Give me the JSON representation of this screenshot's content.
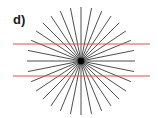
{
  "label": "d)",
  "figure": {
    "name": "Hering illusion",
    "center": [
      81,
      61
    ],
    "ray_count": 32,
    "ray_radius": 54,
    "ray_color": "#3a3a3a",
    "center_dot_color": "#000000",
    "parallel_lines": [
      {
        "y": 44,
        "x1": 13,
        "x2": 150,
        "color": "#d9534a"
      },
      {
        "y": 76,
        "x1": 13,
        "x2": 150,
        "color": "#d9534a"
      }
    ]
  }
}
